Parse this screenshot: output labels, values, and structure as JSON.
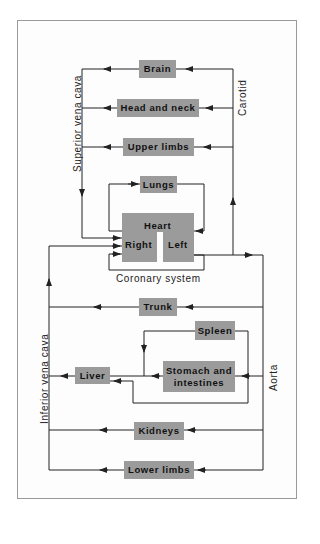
{
  "vessels": {
    "superior_vena_cava": "Superior vena cava",
    "carotid": "Carotid",
    "inferior_vena_cava": "Inferior vena cava",
    "aorta": "Aorta",
    "coronary_system": "Coronary system"
  },
  "organs": {
    "brain": "Brain",
    "head_and_neck": "Head and neck",
    "upper_limbs": "Upper limbs",
    "lungs": "Lungs",
    "heart": "Heart",
    "heart_right": "Right",
    "heart_left": "Left",
    "trunk": "Trunk",
    "spleen": "Spleen",
    "stomach_line1": "Stomach and",
    "stomach_line2": "intestines",
    "liver": "Liver",
    "kidneys": "Kidneys",
    "lower_limbs": "Lower limbs"
  },
  "colors": {
    "box_fill": "#9b9b9b",
    "line": "#222222",
    "frame": "#9a9a9a"
  }
}
